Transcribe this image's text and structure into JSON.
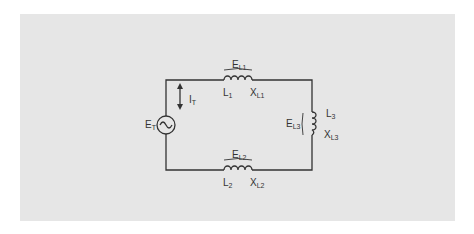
{
  "colors": {
    "panel": "#e6e6e6",
    "wire": "#333333",
    "background": "#ffffff"
  },
  "source": {
    "label": "E",
    "sub": "T"
  },
  "current": {
    "label": "I",
    "sub": "T"
  },
  "inductors": [
    {
      "id": "L1",
      "name": "L",
      "name_sub": "1",
      "reactance": "X",
      "reactance_sub": "L1",
      "voltage": "E",
      "voltage_sub": "L1"
    },
    {
      "id": "L2",
      "name": "L",
      "name_sub": "2",
      "reactance": "X",
      "reactance_sub": "L2",
      "voltage": "E",
      "voltage_sub": "L2"
    },
    {
      "id": "L3",
      "name": "L",
      "name_sub": "3",
      "reactance": "X",
      "reactance_sub": "L3",
      "voltage": "E",
      "voltage_sub": "L3"
    }
  ]
}
